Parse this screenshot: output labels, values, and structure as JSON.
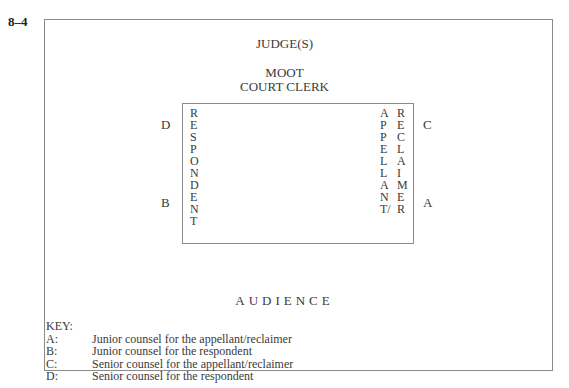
{
  "figure_number": "8–4",
  "labels": {
    "judge": "JUDGE(S)",
    "clerk_line1": "MOOT",
    "clerk_line2": "COURT CLERK",
    "audience": "AUDIENCE"
  },
  "columns": {
    "respondent": [
      "R",
      "E",
      "S",
      "P",
      "O",
      "N",
      "D",
      "E",
      "N",
      "T"
    ],
    "appellant": [
      "A",
      "P",
      "P",
      "E",
      "L",
      "L",
      "A",
      "N",
      "T/"
    ],
    "reclaimer": [
      "R",
      "E",
      "C",
      "L",
      "A",
      "I",
      "M",
      "E",
      "R"
    ]
  },
  "positions": {
    "D": "D",
    "B": "B",
    "C": "C",
    "A": "A"
  },
  "key": {
    "title": "KEY:",
    "items": [
      {
        "letter": "A:",
        "text": "Junior counsel for the appellant/reclaimer"
      },
      {
        "letter": "B:",
        "text": "Junior counsel for the respondent"
      },
      {
        "letter": "C:",
        "text": "Senior counsel for the appellant/reclaimer"
      },
      {
        "letter": "D:",
        "text": "Senior counsel for the respondent"
      }
    ]
  }
}
